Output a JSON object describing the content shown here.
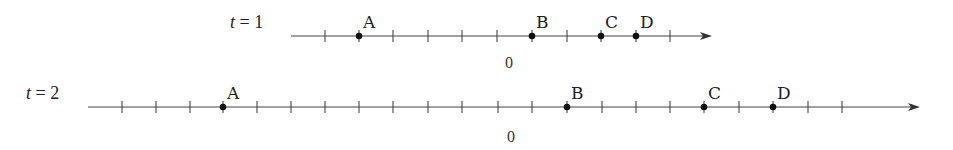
{
  "diagram": {
    "type": "number-lines",
    "lines": [
      {
        "label_var": "t",
        "label_eq": " = 1",
        "y": 36,
        "x_start": 291,
        "x_end": 712,
        "ticks": [
          325,
          359,
          393,
          428,
          462,
          497,
          532,
          567,
          601,
          636,
          670
        ],
        "zero_label": "0",
        "zero_x": 509,
        "zero_y": 68,
        "points": [
          {
            "name": "A",
            "x": 359
          },
          {
            "name": "B",
            "x": 532
          },
          {
            "name": "C",
            "x": 601
          },
          {
            "name": "D",
            "x": 636
          }
        ]
      },
      {
        "label_var": "t",
        "label_eq": " = 2",
        "y": 107,
        "x_start": 88,
        "x_end": 920,
        "ticks": [
          122,
          156,
          190,
          223,
          257,
          291,
          325,
          359,
          393,
          428,
          462,
          498,
          532,
          567,
          602,
          636,
          670,
          704,
          739,
          773,
          808,
          842
        ],
        "zero_label": "0",
        "zero_x": 511,
        "zero_y": 142,
        "points": [
          {
            "name": "A",
            "x": 223
          },
          {
            "name": "B",
            "x": 567
          },
          {
            "name": "C",
            "x": 704
          },
          {
            "name": "D",
            "x": 773
          }
        ]
      }
    ]
  },
  "labels": {
    "line1_t": "t",
    "line1_eq": " = 1",
    "line2_t": "t",
    "line2_eq": " = 2",
    "zero": "0",
    "A": "A",
    "B": "B",
    "C": "C",
    "D": "D"
  }
}
